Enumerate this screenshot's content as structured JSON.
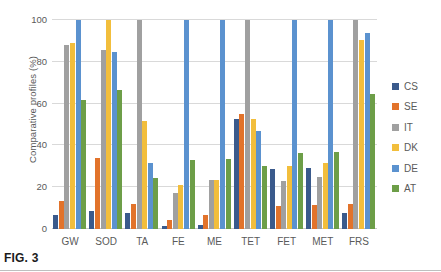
{
  "figure": {
    "caption": "FIG. 3"
  },
  "chart_data": {
    "type": "bar",
    "title": "",
    "xlabel": "",
    "ylabel": "Comparative profiles (%)",
    "ylim": [
      0,
      100
    ],
    "yticks": [
      0,
      20,
      40,
      60,
      80,
      100
    ],
    "ytick_labels": [
      "0",
      "20",
      "40",
      "60",
      "80",
      "100"
    ],
    "grid": true,
    "legend_position": "right",
    "categories": [
      "GW",
      "SOD",
      "TA",
      "FE",
      "ME",
      "TET",
      "FET",
      "MET",
      "FRS"
    ],
    "series": [
      {
        "name": "CS",
        "color": "#3a5a8c",
        "values": [
          6.5,
          8.5,
          7.5,
          1.5,
          2.0,
          52.5,
          28.5,
          29.0,
          7.5
        ]
      },
      {
        "name": "SE",
        "color": "#e2732b",
        "values": [
          13.5,
          34.0,
          12.0,
          4.5,
          6.5,
          55.0,
          11.0,
          11.5,
          12.0
        ]
      },
      {
        "name": "IT",
        "color": "#a0a0a0",
        "values": [
          88.0,
          85.5,
          100.0,
          17.0,
          23.5,
          100.0,
          23.0,
          25.0,
          100.0
        ]
      },
      {
        "name": "DK",
        "color": "#f2be3c",
        "values": [
          89.0,
          100.0,
          51.5,
          21.0,
          23.5,
          52.5,
          30.0,
          31.5,
          90.5
        ]
      },
      {
        "name": "DE",
        "color": "#5b92cf",
        "values": [
          100.0,
          84.5,
          31.5,
          100.0,
          100.0,
          47.0,
          100.0,
          100.0,
          94.0
        ]
      },
      {
        "name": "AT",
        "color": "#6d9e48",
        "values": [
          61.5,
          66.5,
          24.5,
          33.0,
          33.5,
          30.0,
          36.5,
          37.0,
          64.5
        ]
      }
    ]
  }
}
